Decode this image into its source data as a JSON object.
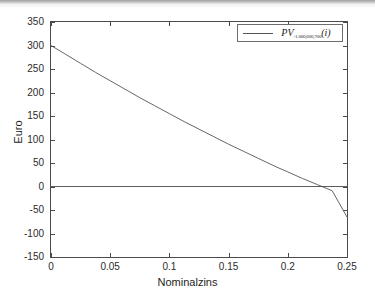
{
  "chart_data": {
    "type": "line",
    "title": "",
    "xlabel": "Nominalzins",
    "ylabel": "Euro",
    "xlim": [
      0,
      0.25
    ],
    "ylim": [
      -150,
      350
    ],
    "grid": false,
    "legend_position": "top-right",
    "xticks": [
      "0",
      "0.05",
      "0.1",
      "0.15",
      "0.2",
      "0.25"
    ],
    "xtick_values": [
      0,
      0.05,
      0.1,
      0.15,
      0.2,
      0.25
    ],
    "yticks": [
      "350",
      "300",
      "250",
      "200",
      "150",
      "100",
      "50",
      "0",
      "-50",
      "-100",
      "-150"
    ],
    "ytick_values": [
      350,
      300,
      250,
      200,
      150,
      100,
      50,
      0,
      -50,
      -100,
      -150
    ],
    "series": [
      {
        "name": "PV_{-1.000,600,700}(i)",
        "name_base": "PV",
        "name_subscript": "-1.000,600,700",
        "name_argument": "(i)",
        "color": "#555555",
        "x": [
          0,
          0.0125,
          0.025,
          0.0375,
          0.05,
          0.0625,
          0.075,
          0.0875,
          0.1,
          0.1125,
          0.125,
          0.1375,
          0.15,
          0.1625,
          0.175,
          0.1875,
          0.19,
          0.2,
          0.2125,
          0.225,
          0.2375,
          0.25
        ],
        "y": [
          300,
          281,
          262,
          243,
          225,
          207,
          189,
          172,
          155,
          138,
          122,
          106,
          90,
          75,
          60,
          45,
          42,
          31,
          17,
          4,
          -9,
          -65
        ]
      },
      {
        "name": "zero-reference",
        "color": "#4b4b4b",
        "x": [
          0,
          0.25
        ],
        "y": [
          0,
          0
        ]
      }
    ],
    "zero_line": 0,
    "zero_crossing_x": 0.19
  },
  "legend": {
    "entries": [
      {
        "base": "PV",
        "subscript": "-1.000,600,700",
        "argument": "(i)"
      }
    ]
  },
  "axis": {
    "x_label": "Nominalzins",
    "y_label": "Euro"
  }
}
